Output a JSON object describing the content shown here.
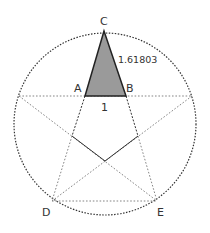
{
  "diagram": {
    "type": "golden-triangle-in-pentagram",
    "labels": {
      "C": "C",
      "A": "A",
      "B": "B",
      "D": "D",
      "E": "E",
      "side_length": "1.61803",
      "base_length": "1"
    },
    "colors": {
      "triangle_fill": "#9a9a9a",
      "outline": "#222222",
      "dotted": "#555555",
      "background": "#ffffff"
    },
    "points": {
      "C": [
        104,
        31
      ],
      "A": [
        85,
        96
      ],
      "B": [
        126,
        96
      ],
      "left": [
        19,
        96
      ],
      "right": [
        192,
        96
      ],
      "D": [
        52,
        201
      ],
      "E": [
        157,
        201
      ],
      "inner_left": [
        72,
        136
      ],
      "inner_right": [
        138,
        136
      ],
      "inner_bottom": [
        105,
        161
      ]
    },
    "circle": {
      "cx": 105,
      "cy": 124,
      "r": 91
    }
  }
}
